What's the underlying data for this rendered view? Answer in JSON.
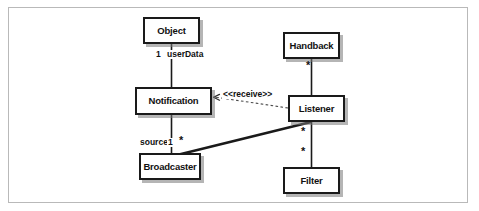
{
  "diagram": {
    "type": "uml-class-diagram",
    "frame": {
      "visible": true,
      "border_color": "#b9b9b9"
    },
    "classes": [
      {
        "id": "object",
        "name": "Object",
        "x": 143,
        "y": 17,
        "w": 57,
        "h": 27
      },
      {
        "id": "notification",
        "name": "Notification",
        "x": 135,
        "y": 87,
        "w": 77,
        "h": 28
      },
      {
        "id": "broadcaster",
        "name": "Broadcaster",
        "x": 139,
        "y": 153,
        "w": 62,
        "h": 27
      },
      {
        "id": "handback",
        "name": "Handback",
        "x": 283,
        "y": 32,
        "w": 57,
        "h": 27
      },
      {
        "id": "listener",
        "name": "Listener",
        "x": 288,
        "y": 95,
        "w": 57,
        "h": 27
      },
      {
        "id": "filter",
        "name": "Filter",
        "x": 283,
        "y": 167,
        "w": 57,
        "h": 27
      }
    ],
    "associations": [
      {
        "id": "object-notification",
        "from": "object",
        "to": "notification",
        "style": "solid",
        "thickness": "thin",
        "labels": [
          {
            "text": "1",
            "x": 155,
            "y": 50
          },
          {
            "text": "userData",
            "x": 165,
            "y": 50
          }
        ]
      },
      {
        "id": "notification-broadcaster",
        "from": "notification",
        "to": "broadcaster",
        "style": "solid",
        "thickness": "thin",
        "labels": [
          {
            "text": "source",
            "x": 140,
            "y": 139
          },
          {
            "text": "1",
            "x": 167,
            "y": 139
          }
        ]
      },
      {
        "id": "broadcaster-listener",
        "from": "broadcaster",
        "to": "listener",
        "style": "solid",
        "thickness": "thick",
        "labels": []
      },
      {
        "id": "handback-listener",
        "from": "handback",
        "to": "listener",
        "style": "solid",
        "thickness": "thin",
        "labels": []
      },
      {
        "id": "listener-filter",
        "from": "listener",
        "to": "filter",
        "style": "solid",
        "thickness": "thin",
        "labels": []
      },
      {
        "id": "listener-notification-receive",
        "from": "listener",
        "to": "notification",
        "style": "dashed",
        "thickness": "thin",
        "arrow": "open",
        "stereotype": "<<receive>>"
      }
    ],
    "multiplicities": [
      {
        "id": "mult-handback-listener",
        "text": "*",
        "x": 307,
        "y": 62
      },
      {
        "id": "mult-broadcaster-listener",
        "text": "*",
        "x": 180,
        "y": 137
      },
      {
        "id": "mult-listener-broadcaster",
        "text": "*",
        "x": 302,
        "y": 128
      },
      {
        "id": "mult-listener-filter",
        "text": "*",
        "x": 302,
        "y": 148
      }
    ],
    "stereotype_label": {
      "text": "<<receive>>",
      "x": 222,
      "y": 93
    },
    "colors": {
      "box_border": "#1a1a1a",
      "box_fill": "#ffffff",
      "line": "#1a1a1a",
      "shadow": "#787878",
      "frame_border": "#b9b9b9",
      "text": "#111111"
    }
  }
}
